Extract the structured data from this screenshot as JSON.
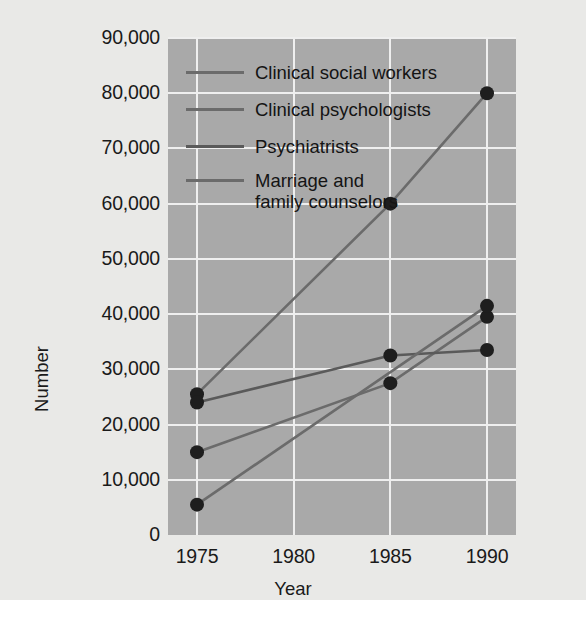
{
  "chart_data": {
    "type": "line",
    "title": "",
    "xlabel": "Year",
    "ylabel": "Number",
    "x": [
      1975,
      1985,
      1990
    ],
    "xlim": [
      1973.5,
      1991.5
    ],
    "ylim": [
      0,
      90000
    ],
    "grid": true,
    "legend_position": "top-left-inside",
    "xtick_labels": [
      "1975",
      "1980",
      "1985",
      "1990"
    ],
    "xtick_values": [
      1975,
      1980,
      1985,
      1990
    ],
    "ytick_labels": [
      "0",
      "10,000",
      "20,000",
      "30,000",
      "40,000",
      "50,000",
      "60,000",
      "70,000",
      "80,000",
      "90,000"
    ],
    "ytick_values": [
      0,
      10000,
      20000,
      30000,
      40000,
      50000,
      60000,
      70000,
      80000,
      90000
    ],
    "series": [
      {
        "name": "Clinical social workers",
        "color": "#6b6b6b",
        "points": [
          {
            "x": 1975,
            "y": 25500
          },
          {
            "x": 1985,
            "y": 60000
          },
          {
            "x": 1990,
            "y": 80000
          }
        ]
      },
      {
        "name": "Clinical psychologists",
        "color": "#6b6b6b",
        "points": [
          {
            "x": 1975,
            "y": 15000
          },
          {
            "x": 1985,
            "y": 27500
          },
          {
            "x": 1990,
            "y": 39500
          }
        ]
      },
      {
        "name": "Psychiatrists",
        "color": "#5a5a5a",
        "points": [
          {
            "x": 1975,
            "y": 24000
          },
          {
            "x": 1985,
            "y": 32500
          },
          {
            "x": 1990,
            "y": 33500
          }
        ]
      },
      {
        "name": "Marriage and\nfamily counselors",
        "color": "#6b6b6b",
        "points": [
          {
            "x": 1975,
            "y": 5500
          },
          {
            "x": 1990,
            "y": 41500
          }
        ]
      }
    ]
  },
  "legend": {
    "items": [
      {
        "label": "Clinical social workers"
      },
      {
        "label": "Clinical psychologists"
      },
      {
        "label": "Psychiatrists"
      },
      {
        "label": "Marriage and\nfamily counselors"
      }
    ]
  },
  "axes": {
    "y_title": "Number",
    "x_title": "Year"
  },
  "colors": {
    "plot_background": "#a9a9a9",
    "page_background": "#e9e9e7",
    "gridline": "#efefef",
    "line": "#6b6b6b",
    "marker": "#1e1e1e",
    "text": "#1a1a1a"
  }
}
